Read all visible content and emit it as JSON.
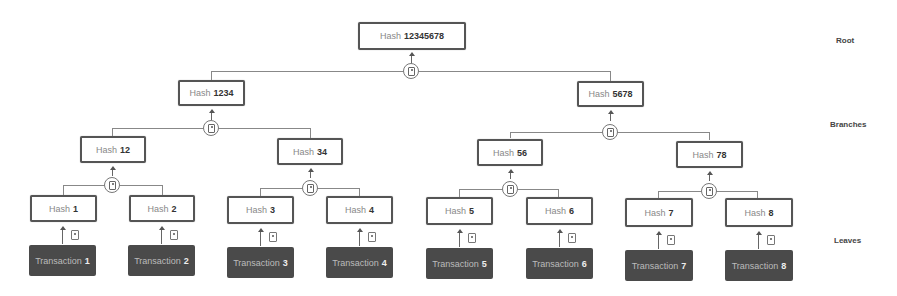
{
  "diagram": {
    "prefix_hash": "Hash",
    "prefix_tx": "Transaction",
    "levels": {
      "root": "Root",
      "branches": "Branches",
      "leaves": "Leaves"
    },
    "root": {
      "id": "12345678"
    },
    "level1": [
      {
        "id": "1234"
      },
      {
        "id": "5678"
      }
    ],
    "level2": [
      {
        "id": "12"
      },
      {
        "id": "34"
      },
      {
        "id": "56"
      },
      {
        "id": "78"
      }
    ],
    "leaf_hashes": [
      {
        "id": "1"
      },
      {
        "id": "2"
      },
      {
        "id": "3"
      },
      {
        "id": "4"
      },
      {
        "id": "5"
      },
      {
        "id": "6"
      },
      {
        "id": "7"
      },
      {
        "id": "8"
      }
    ],
    "transactions": [
      {
        "id": "1"
      },
      {
        "id": "2"
      },
      {
        "id": "3"
      },
      {
        "id": "4"
      },
      {
        "id": "5"
      },
      {
        "id": "6"
      },
      {
        "id": "7"
      },
      {
        "id": "8"
      }
    ],
    "colors": {
      "box_border": "#555555",
      "transaction_fill": "#4a4a4a",
      "connector": "#888888"
    }
  }
}
